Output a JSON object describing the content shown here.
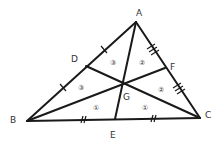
{
  "diagram": {
    "type": "triangle-medians",
    "colors": {
      "stroke": "#1a1a1a",
      "text": "#333333",
      "background": "#ffffff"
    },
    "vertices": {
      "A": {
        "label": "A",
        "x": 136,
        "y": 22
      },
      "B": {
        "label": "B",
        "x": 27,
        "y": 121
      },
      "C": {
        "label": "C",
        "x": 200,
        "y": 118
      }
    },
    "midpoints": {
      "D": {
        "label": "D",
        "x": 86,
        "y": 66
      },
      "E": {
        "label": "E",
        "x": 115,
        "y": 119
      },
      "F": {
        "label": "F",
        "x": 165,
        "y": 68
      }
    },
    "centroid": {
      "label": "G",
      "x": 123,
      "y": 84
    },
    "regions": [
      {
        "label": "③",
        "x": 113,
        "y": 62
      },
      {
        "label": "②",
        "x": 142,
        "y": 62
      },
      {
        "label": "③",
        "x": 81,
        "y": 87
      },
      {
        "label": "②",
        "x": 161,
        "y": 89
      },
      {
        "label": "①",
        "x": 96,
        "y": 107
      },
      {
        "label": "①",
        "x": 145,
        "y": 107
      }
    ]
  }
}
